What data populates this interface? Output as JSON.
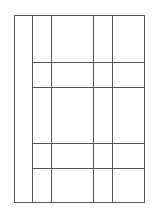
{
  "diagram": {
    "type": "grid-table-outline",
    "stroke_color": "#555555",
    "background": "#ffffff",
    "outer_box": {
      "x1": 14,
      "y1": 15,
      "x2": 144,
      "y2": 202
    },
    "vertical_lines": [
      32,
      51,
      93,
      112
    ],
    "horizontal_lines": {
      "x_start": 32,
      "x_end": 144,
      "ys": [
        62,
        87,
        143,
        168
      ]
    }
  }
}
